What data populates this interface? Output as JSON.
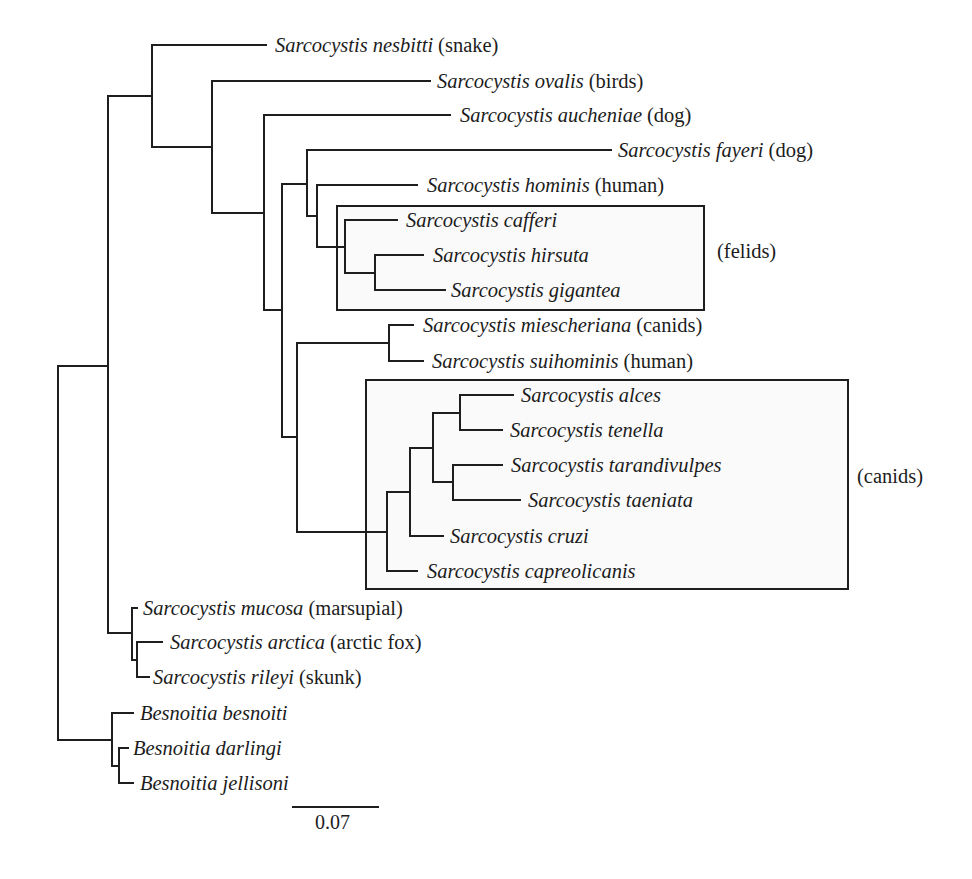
{
  "figure": {
    "kind": "phylogenetic-tree",
    "topology_newick": "((S_nesbitti,(S_ovalis,(S_aucheniae,((S_fayeri,(S_hominis,(S_cafferi,(S_hirsuta,S_gigantea)))),((S_miescheriana,S_suihominis),((((S_alces,S_tenella),(S_tarandivulpes,S_taeniata)),S_cruzi),S_capreolicanis)))))),(S_mucosa,(S_arctica,S_rileyi))),(B_besnoiti,(B_darlingi,B_jellisoni)));"
  },
  "taxa": [
    {
      "species": "Sarcocystis nesbitti",
      "host": "(snake)"
    },
    {
      "species": "Sarcocystis ovalis",
      "host": "(birds)"
    },
    {
      "species": "Sarcocystis aucheniae",
      "host": "(dog)"
    },
    {
      "species": "Sarcocystis fayeri",
      "host": "(dog)"
    },
    {
      "species": "Sarcocystis hominis",
      "host": "(human)"
    },
    {
      "species": "Sarcocystis cafferi",
      "host": ""
    },
    {
      "species": "Sarcocystis hirsuta",
      "host": ""
    },
    {
      "species": "Sarcocystis gigantea",
      "host": ""
    },
    {
      "species": "Sarcocystis miescheriana",
      "host": "(canids)"
    },
    {
      "species": "Sarcocystis suihominis",
      "host": "(human)"
    },
    {
      "species": "Sarcocystis alces",
      "host": ""
    },
    {
      "species": "Sarcocystis tenella",
      "host": ""
    },
    {
      "species": "Sarcocystis tarandivulpes",
      "host": ""
    },
    {
      "species": "Sarcocystis taeniata",
      "host": ""
    },
    {
      "species": "Sarcocystis cruzi",
      "host": ""
    },
    {
      "species": "Sarcocystis capreolicanis",
      "host": ""
    },
    {
      "species": "Sarcocystis mucosa",
      "host": "(marsupial)"
    },
    {
      "species": "Sarcocystis arctica",
      "host": "(arctic fox)"
    },
    {
      "species": "Sarcocystis rileyi",
      "host": "(skunk)"
    },
    {
      "species": "Besnoitia besnoiti",
      "host": ""
    },
    {
      "species": "Besnoitia darlingi",
      "host": ""
    },
    {
      "species": "Besnoitia jellisoni",
      "host": ""
    }
  ],
  "clade_boxes": [
    {
      "label": "(felids)",
      "members": [
        "Sarcocystis cafferi",
        "Sarcocystis hirsuta",
        "Sarcocystis gigantea"
      ]
    },
    {
      "label": "(canids)",
      "members": [
        "Sarcocystis alces",
        "Sarcocystis tenella",
        "Sarcocystis tarandivulpes",
        "Sarcocystis taeniata",
        "Sarcocystis cruzi",
        "Sarcocystis capreolicanis"
      ]
    }
  ],
  "scale_bar": {
    "value": "0.07"
  },
  "colors": {
    "ink": "#1e1e1e",
    "background": "#ffffff",
    "box_fill": "#fafafa"
  }
}
